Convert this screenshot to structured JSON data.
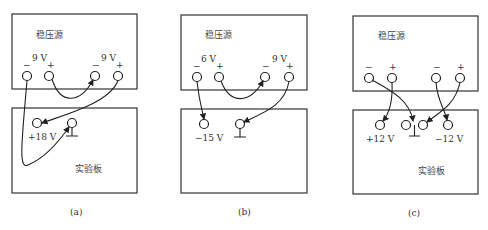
{
  "panels": [
    {
      "caption": "(a)",
      "source_label": "稳压源",
      "board_label": "实验板",
      "left_voltage": "9 V",
      "right_voltage": "9 V",
      "minus": "−",
      "plus": "+",
      "output_label": "+18 V"
    },
    {
      "caption": "(b)",
      "source_label": "稳压源",
      "board_label": "",
      "left_voltage": "6 V",
      "right_voltage": "9 V",
      "minus": "−",
      "plus": "+",
      "output_label": "−15 V"
    },
    {
      "caption": "(c)",
      "source_label": "稳压源",
      "board_label": "实验板",
      "minus": "−",
      "plus": "+",
      "pos_output_label": "+12 V",
      "neg_output_label": "−12 V"
    }
  ]
}
